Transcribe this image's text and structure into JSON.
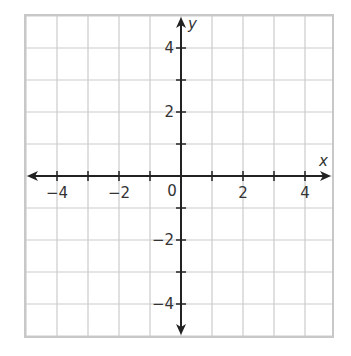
{
  "chart_data": {
    "type": "scatter",
    "title": "",
    "xlabel": "x",
    "ylabel": "y",
    "xlim": [
      -5,
      5
    ],
    "ylim": [
      -5,
      5
    ],
    "grid": true,
    "grid_step": 1,
    "x_ticks": [
      -4,
      -3,
      -2,
      -1,
      1,
      2,
      3,
      4
    ],
    "y_ticks": [
      -4,
      -3,
      -2,
      -1,
      1,
      2,
      3,
      4
    ],
    "x_tick_labels": [
      {
        "value": -4,
        "label": "−4"
      },
      {
        "value": -2,
        "label": "−2"
      },
      {
        "value": 2,
        "label": "2"
      },
      {
        "value": 4,
        "label": "4"
      }
    ],
    "y_tick_labels": [
      {
        "value": 4,
        "label": "4"
      },
      {
        "value": 2,
        "label": "2"
      },
      {
        "value": -2,
        "label": "−2"
      },
      {
        "value": -4,
        "label": "−4"
      }
    ],
    "origin_label": "0",
    "series": [],
    "axes_arrows": true,
    "legend": null
  },
  "colors": {
    "grid": "#cccccc",
    "axis": "#222222",
    "label": "#333333",
    "background": "#ffffff"
  },
  "geometry": {
    "plot_left": 25,
    "plot_top": 15,
    "plot_right": 333,
    "plot_bottom": 337,
    "origin_x": 181,
    "origin_y": 176,
    "unit_x": 31,
    "unit_y": 32
  }
}
